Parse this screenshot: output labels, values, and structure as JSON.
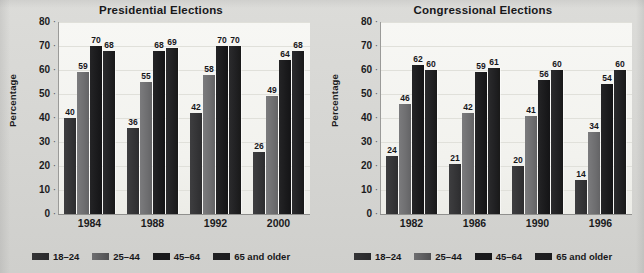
{
  "figure": {
    "background_color": "#d9d9d6",
    "plot_background_color": "#f5f5f2"
  },
  "series_names": [
    "18–24",
    "25–44",
    "45–64",
    "65 and older"
  ],
  "series_colors": [
    "#343436",
    "#6e6e70",
    "#1a1a1c",
    "#202022"
  ],
  "yaxis": {
    "label": "Percentage",
    "ticks": [
      "80",
      "70",
      "60",
      "50",
      "40",
      "30",
      "20",
      "10",
      "0"
    ],
    "min": 0,
    "max": 80,
    "step": 10
  },
  "legend": {
    "items": [
      {
        "label": "18–24",
        "color": "#343436",
        "swatch": "legend-swatch"
      },
      {
        "label": "25–44",
        "color": "#6e6e70",
        "swatch": "legend-swatch"
      },
      {
        "label": "45–64",
        "color": "#1a1a1c",
        "swatch": "legend-swatch"
      },
      {
        "label": "65 and older",
        "color": "#202022",
        "swatch": "legend-swatch"
      }
    ]
  },
  "chart_data": [
    {
      "type": "bar",
      "title": "Presidential Elections",
      "xlabel": "",
      "ylabel": "Percentage",
      "ylim": [
        0,
        80
      ],
      "ytick_step": 10,
      "grid": true,
      "legend_position": "bottom",
      "categories": [
        "1984",
        "1988",
        "1992",
        "2000"
      ],
      "series": [
        {
          "name": "18–24",
          "values": [
            40,
            36,
            42,
            26
          ]
        },
        {
          "name": "25–44",
          "values": [
            59,
            55,
            58,
            49
          ]
        },
        {
          "name": "45–64",
          "values": [
            70,
            68,
            70,
            64
          ]
        },
        {
          "name": "65 and older",
          "values": [
            68,
            69,
            70,
            68
          ]
        }
      ]
    },
    {
      "type": "bar",
      "title": "Congressional Elections",
      "xlabel": "",
      "ylabel": "Percentage",
      "ylim": [
        0,
        80
      ],
      "ytick_step": 10,
      "grid": true,
      "legend_position": "bottom",
      "categories": [
        "1982",
        "1986",
        "1990",
        "1996"
      ],
      "series": [
        {
          "name": "18–24",
          "values": [
            24,
            21,
            20,
            14
          ]
        },
        {
          "name": "25–44",
          "values": [
            46,
            42,
            41,
            34
          ]
        },
        {
          "name": "45–64",
          "values": [
            62,
            59,
            56,
            54
          ]
        },
        {
          "name": "65 and older",
          "values": [
            60,
            61,
            60,
            60
          ]
        }
      ]
    }
  ]
}
